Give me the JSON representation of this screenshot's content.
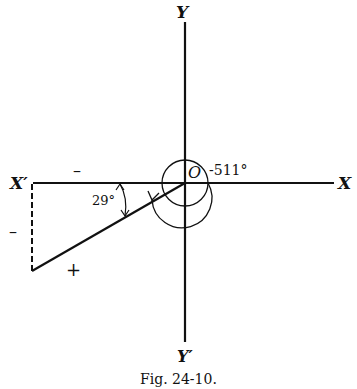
{
  "figure": {
    "caption": "Fig. 24-10.",
    "axes": {
      "x_positive": "X",
      "x_negative": "X′",
      "y_positive": "Y",
      "y_negative": "Y′",
      "origin": "O"
    },
    "angle_label": "-511°",
    "reference_angle": "29°",
    "signs": {
      "x_component": "–",
      "y_component": "–",
      "hypotenuse": "+"
    }
  }
}
